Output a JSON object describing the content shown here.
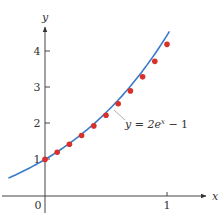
{
  "chart_data": {
    "type": "scatter",
    "title": "",
    "xlabel": "x",
    "ylabel": "y",
    "xlim": [
      -0.37,
      1.3
    ],
    "ylim": [
      -0.6,
      4.7
    ],
    "x_ticks": [
      0,
      1
    ],
    "x_tick_labels": [
      "0",
      "1"
    ],
    "y_ticks": [
      1,
      2,
      3,
      4
    ],
    "y_tick_labels": [
      "1",
      "2",
      "3",
      "4"
    ],
    "grid": false,
    "legend": null,
    "series": [
      {
        "name": "y = 2e^x − 1",
        "kind": "line",
        "color": "#3a7bc8",
        "x": [
          -0.3,
          -0.2,
          -0.1,
          0,
          0.1,
          0.2,
          0.3,
          0.4,
          0.5,
          0.6,
          0.7,
          0.8,
          0.9,
          1.0,
          1.02
        ],
        "values": [
          0.4816,
          0.6375,
          0.8097,
          1.0,
          1.2103,
          1.4428,
          1.6997,
          1.9836,
          2.2974,
          2.6442,
          3.0275,
          3.4511,
          3.9192,
          4.4366,
          4.5449
        ]
      },
      {
        "name": "Euler approximation",
        "kind": "points",
        "color": "#d9302c",
        "x": [
          0,
          0.1,
          0.2,
          0.3,
          0.4,
          0.5,
          0.6,
          0.7,
          0.8,
          0.9,
          1.0
        ],
        "values": [
          1.0,
          1.2,
          1.42,
          1.662,
          1.928,
          2.221,
          2.543,
          2.897,
          3.287,
          3.716,
          4.187
        ]
      }
    ],
    "annotations": [
      {
        "text": "y = 2e",
        "superscript": "x",
        "suffix": " − 1",
        "at": [
          0.65,
          2.0
        ]
      }
    ]
  },
  "labels": {
    "y_axis_name": "y",
    "x_axis_name": "x",
    "origin": "0",
    "x_tick_1": "1",
    "y_tick_1": "1",
    "y_tick_2": "2",
    "y_tick_3": "3",
    "y_tick_4": "4",
    "curve_label_main": "y = 2e",
    "curve_label_sup": "x",
    "curve_label_tail": " − 1"
  }
}
